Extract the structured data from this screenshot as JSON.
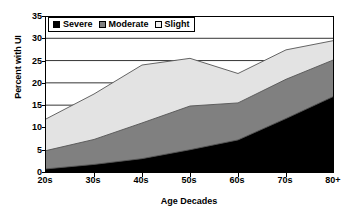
{
  "chart_data": {
    "type": "area",
    "stacked": true,
    "title": "",
    "xlabel": "Age Decades",
    "ylabel": "Percent with UI",
    "categories": [
      "20s",
      "30s",
      "40s",
      "50s",
      "60s",
      "70s",
      "80+"
    ],
    "ylim": [
      0,
      35
    ],
    "yticks": [
      0,
      5,
      10,
      15,
      20,
      25,
      30,
      35
    ],
    "ytick_labels": [
      "0",
      "5",
      "10",
      "15",
      "20",
      "25",
      "30",
      "35"
    ],
    "grid": true,
    "grid_axis": "y",
    "legend_position": "top-left-inside",
    "series": [
      {
        "name": "Severe",
        "color": "#000000",
        "values": [
          0.7,
          1.7,
          3.0,
          5.0,
          7.2,
          12.0,
          17.0
        ]
      },
      {
        "name": "Moderate",
        "color": "#808080",
        "values": [
          4.1,
          5.6,
          8.0,
          9.8,
          8.3,
          8.8,
          8.2
        ]
      },
      {
        "name": "Slight",
        "color": "#e3e3e3",
        "values": [
          7.1,
          10.2,
          13.0,
          10.7,
          6.6,
          6.6,
          4.3
        ]
      }
    ],
    "cumulative": {
      "severe": [
        0.7,
        1.7,
        3.0,
        5.0,
        7.2,
        12.0,
        17.0
      ],
      "severe_plus_moderate": [
        4.8,
        7.3,
        11.0,
        14.8,
        15.5,
        20.8,
        25.2
      ],
      "total": [
        11.9,
        17.5,
        24.0,
        25.5,
        22.1,
        27.4,
        29.5
      ]
    }
  },
  "legend": {
    "items": [
      {
        "label": "Severe",
        "color": "#000000"
      },
      {
        "label": "Moderate",
        "color": "#808080"
      },
      {
        "label": "Slight",
        "color": "#efefef"
      }
    ]
  },
  "axes": {
    "y_title": "Percent with UI",
    "x_title": "Age Decades"
  },
  "colors": {
    "severe": "#000000",
    "moderate": "#808080",
    "slight": "#e3e3e3",
    "axis": "#000000",
    "grid": "#000000",
    "background": "#ffffff"
  }
}
